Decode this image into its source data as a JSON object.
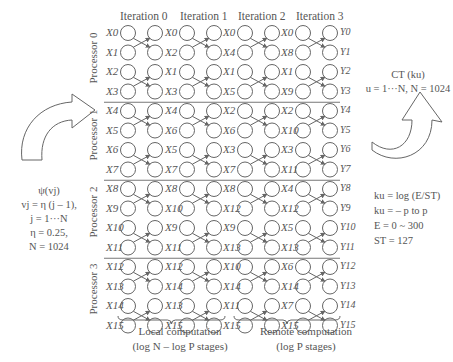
{
  "iterations": [
    "Iteration 0",
    "Iteration 1",
    "Iteration 2",
    "Iteration 3"
  ],
  "processors": [
    "Processor 0",
    "Processor 1",
    "Processor 2",
    "Processor 3"
  ],
  "columns": [
    [
      "X0",
      "X1",
      "X2",
      "X3",
      "X4",
      "X5",
      "X6",
      "X7",
      "X8",
      "X9",
      "X10",
      "X11",
      "X12",
      "X13",
      "X14",
      "X15"
    ],
    [
      "X0",
      "X2",
      "X1",
      "X3",
      "X4",
      "X6",
      "X5",
      "X7",
      "X8",
      "X10",
      "X9",
      "X11",
      "X12",
      "X14",
      "X13",
      "X15"
    ],
    [
      "X0",
      "X4",
      "X1",
      "X5",
      "X2",
      "X6",
      "X3",
      "X7",
      "X8",
      "X12",
      "X9",
      "X13",
      "X10",
      "X14",
      "X11",
      "X15"
    ],
    [
      "X0",
      "X8",
      "X1",
      "X9",
      "X2",
      "X10",
      "X3",
      "X11",
      "X4",
      "X12",
      "X5",
      "X13",
      "X6",
      "X14",
      "X7",
      "X15"
    ]
  ],
  "outputs": [
    "Y0",
    "Y1",
    "Y2",
    "Y3",
    "Y4",
    "Y5",
    "Y6",
    "Y7",
    "Y8",
    "Y9",
    "Y10",
    "Y11",
    "Y12",
    "Y13",
    "Y14",
    "Y15"
  ],
  "left_note": {
    "line1": "ψ(vj)",
    "line2": "vj = η (j – 1),",
    "line3": "j = 1···N",
    "line4": "η = 0.25,",
    "line5": "N = 1024"
  },
  "right_top_note": {
    "line1": "CT (ku)",
    "line2": "u = 1···N, N = 1024"
  },
  "right_bottom_note": {
    "line1": "ku = log (E/ST)",
    "line2": "ku = – p to p",
    "line3": "E = 0 ~ 300",
    "line4": "ST = 127"
  },
  "captions": {
    "local_line1": "Local computation",
    "local_line2": "(log N – log P stages)",
    "remote_line1": "Remote computation",
    "remote_line2": "(log P stages)"
  },
  "colors": {
    "stroke": "#666666",
    "text": "#555555",
    "divider": "#777777"
  }
}
